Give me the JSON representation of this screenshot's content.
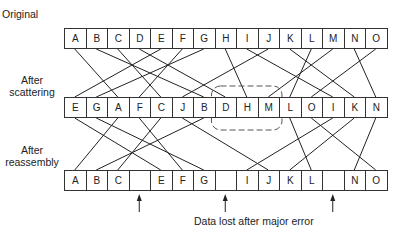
{
  "labels": {
    "original": "Original",
    "after_scattering_1": "After",
    "after_scattering_2": "scattering",
    "after_reassembly_1": "After",
    "after_reassembly_2": "reassembly",
    "caption": "Data lost after major error"
  },
  "rows": {
    "original": [
      "A",
      "B",
      "C",
      "D",
      "E",
      "F",
      "G",
      "H",
      "I",
      "J",
      "K",
      "L",
      "M",
      "N",
      "O"
    ],
    "scattered": [
      "E",
      "G",
      "A",
      "F",
      "C",
      "J",
      "B",
      "D",
      "H",
      "M",
      "L",
      "O",
      "I",
      "K",
      "N"
    ],
    "reassembled": [
      "A",
      "B",
      "C",
      "",
      "E",
      "F",
      "G",
      "",
      "I",
      "J",
      "K",
      "L",
      "",
      "N",
      "O"
    ]
  },
  "lost_blocks": [
    "D",
    "H",
    "M"
  ],
  "highlight": {
    "description": "dashed rounded box around scattered blocks D, H, M",
    "blocks": [
      "D",
      "H",
      "M"
    ]
  },
  "colors": {
    "line": "#222222",
    "box_border": "#333333",
    "dashed": "#555555",
    "accent": "#d04040"
  }
}
